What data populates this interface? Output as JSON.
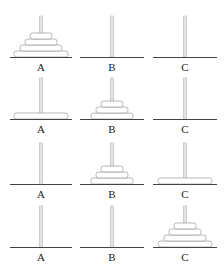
{
  "pegs": [
    "A",
    "B",
    "C"
  ],
  "disk_sizes": [
    1,
    2,
    3,
    4
  ],
  "states": [
    {
      "step": 1,
      "A": [
        4,
        3,
        2,
        1
      ],
      "B": [],
      "C": []
    },
    {
      "step": 2,
      "A": [
        4
      ],
      "B": [
        3,
        2,
        1
      ],
      "C": []
    },
    {
      "step": 3,
      "A": [],
      "B": [
        3,
        2,
        1
      ],
      "C": [
        4
      ]
    },
    {
      "step": 4,
      "A": [],
      "B": [],
      "C": [
        4,
        3,
        2,
        1
      ]
    }
  ],
  "colors": {
    "disk_fill": "#ffffff",
    "disk_stroke": "#9a9a9a",
    "peg": "#e4e4e4",
    "base": "#444444"
  }
}
